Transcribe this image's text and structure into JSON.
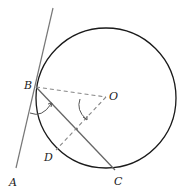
{
  "diagram": {
    "labels": {
      "A": "A",
      "B": "B",
      "C": "C",
      "D": "D",
      "O": "O"
    },
    "colors": {
      "circle": "#1a1a1a",
      "tangent": "#777777",
      "chord": "#666666",
      "dashed": "#888888",
      "arc": "#555555"
    }
  }
}
